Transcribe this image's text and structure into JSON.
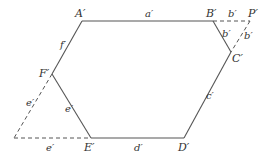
{
  "diagram": {
    "vertices": [
      {
        "id": "A",
        "label": "A′",
        "x": 82,
        "y": 21,
        "lx": 75,
        "ly": 17
      },
      {
        "id": "B",
        "label": "B′",
        "x": 213,
        "y": 21,
        "lx": 206,
        "ly": 17
      },
      {
        "id": "P",
        "label": "P′",
        "x": 250,
        "y": 21,
        "lx": 248,
        "ly": 17
      },
      {
        "id": "C",
        "label": "C′",
        "x": 231,
        "y": 52,
        "lx": 232,
        "ly": 62
      },
      {
        "id": "D",
        "label": "D′",
        "x": 184,
        "y": 138,
        "lx": 178,
        "ly": 151
      },
      {
        "id": "E",
        "label": "E′",
        "x": 91,
        "y": 138,
        "lx": 84,
        "ly": 151
      },
      {
        "id": "F",
        "label": "F′",
        "x": 52,
        "y": 74,
        "lx": 39,
        "ly": 77
      },
      {
        "id": "Q",
        "label": "",
        "x": 14,
        "y": 138
      }
    ],
    "solid_edges": [
      {
        "from": "A",
        "to": "B",
        "label": "a′",
        "lx": 145,
        "ly": 17
      },
      {
        "from": "B",
        "to": "C",
        "label": "b′",
        "lx": 222,
        "ly": 37
      },
      {
        "from": "C",
        "to": "D",
        "label": "c′",
        "lx": 206,
        "ly": 99
      },
      {
        "from": "D",
        "to": "E",
        "label": "d′",
        "lx": 134,
        "ly": 151
      },
      {
        "from": "E",
        "to": "F",
        "label": "e′",
        "lx": 65,
        "ly": 112
      },
      {
        "from": "F",
        "to": "A",
        "label": "f′",
        "lx": 60,
        "ly": 48
      }
    ],
    "dashed_edges": [
      {
        "from": "B",
        "to": "P",
        "label": "b′",
        "lx": 228,
        "ly": 17
      },
      {
        "from": "P",
        "to": "C",
        "label": "b′",
        "lx": 244,
        "ly": 39
      },
      {
        "from": "F",
        "to": "Q",
        "label": "e′",
        "lx": 26,
        "ly": 106
      },
      {
        "from": "Q",
        "to": "E",
        "label": "e′",
        "lx": 46,
        "ly": 151
      }
    ]
  }
}
